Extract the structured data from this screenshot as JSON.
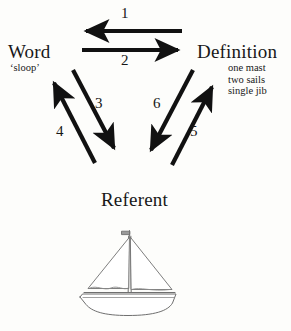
{
  "diagram": {
    "vertices": [
      {
        "id": "word",
        "label": "Word",
        "sub": "‘sloop’"
      },
      {
        "id": "definition",
        "label": "Definition",
        "sub_lines": [
          "one mast",
          "two sails",
          "single jib"
        ]
      },
      {
        "id": "referent",
        "label": "Referent",
        "sub": ""
      }
    ],
    "definition_sub_line_1": "one mast",
    "definition_sub_line_2": "two sails",
    "definition_sub_line_3": "single jib",
    "arrows": [
      {
        "number": "1",
        "from": "definition",
        "to": "word",
        "direction": "left",
        "style": "solid-thick"
      },
      {
        "number": "2",
        "from": "word",
        "to": "definition",
        "direction": "right",
        "style": "solid-thick"
      },
      {
        "number": "3",
        "from": "word",
        "to": "referent",
        "direction": "down-right",
        "style": "solid-thick"
      },
      {
        "number": "4",
        "from": "referent",
        "to": "word",
        "direction": "up-left",
        "style": "solid-thick"
      },
      {
        "number": "5",
        "from": "referent",
        "to": "definition",
        "direction": "up-right",
        "style": "solid-thick"
      },
      {
        "number": "6",
        "from": "definition",
        "to": "referent",
        "direction": "down-left",
        "style": "solid-thick"
      }
    ],
    "illustration": {
      "name": "sailboat-sloop",
      "parts": [
        "pennant",
        "mast",
        "jib-sail",
        "main-sail",
        "boom",
        "hull",
        "deck-line"
      ]
    },
    "colors": {
      "background": "#fdfdfb",
      "text": "#181818",
      "arrow": "#111111",
      "illustration_line": "#6f6f6f"
    }
  }
}
